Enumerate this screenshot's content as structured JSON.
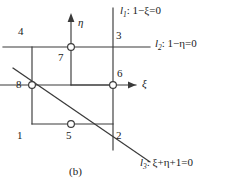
{
  "figure": {
    "caption": "(b)",
    "axes": [
      {
        "name": "eta-axis",
        "label": "η",
        "direction": "up"
      },
      {
        "name": "xi-axis",
        "label": "ξ",
        "direction": "right"
      }
    ],
    "nodes": [
      {
        "id": "1",
        "label": "1",
        "x": 32,
        "y": 124,
        "marker": false
      },
      {
        "id": "2",
        "label": "2",
        "x": 113,
        "y": 124,
        "marker": false
      },
      {
        "id": "3",
        "label": "3",
        "x": 113,
        "y": 47,
        "marker": false
      },
      {
        "id": "4",
        "label": "4",
        "x": 32,
        "y": 47,
        "marker": false
      },
      {
        "id": "5",
        "label": "5",
        "x": 71,
        "y": 124,
        "marker": true
      },
      {
        "id": "6",
        "label": "6",
        "x": 113,
        "y": 85,
        "marker": true
      },
      {
        "id": "7",
        "label": "7",
        "x": 71,
        "y": 47,
        "marker": true
      },
      {
        "id": "8",
        "label": "8",
        "x": 32,
        "y": 85,
        "marker": true
      }
    ],
    "lines": [
      {
        "id": "l1",
        "name": "line-l1",
        "label_prefix": "l",
        "label_sub": "1",
        "equation": ": 1−ξ=0",
        "full": "l₁ : 1−ξ=0"
      },
      {
        "id": "l2",
        "name": "line-l2",
        "label_prefix": "l",
        "label_sub": "2",
        "equation": ": 1−η=0",
        "full": "l₂ : 1−η=0"
      },
      {
        "id": "l3",
        "name": "line-l3",
        "label_prefix": "l",
        "label_sub": "3",
        "equation": ": ξ+η+1=0",
        "full": "l₃ : ξ+η+1=0"
      }
    ],
    "colors": {
      "stroke": "#3a3a3a",
      "text": "#1a1a1a",
      "background": "#ffffff"
    }
  }
}
